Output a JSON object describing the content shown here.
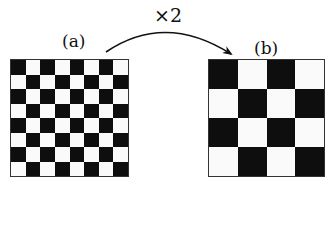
{
  "scale_label": "×2",
  "panels": [
    {
      "label": "(a)",
      "size": 8,
      "first_cell": "dark"
    },
    {
      "label": "(b)",
      "size": 4,
      "first_cell": "dark"
    }
  ],
  "colors": {
    "dark": "#0e0e0e",
    "light": "#fafafa",
    "stroke": "#111111"
  }
}
